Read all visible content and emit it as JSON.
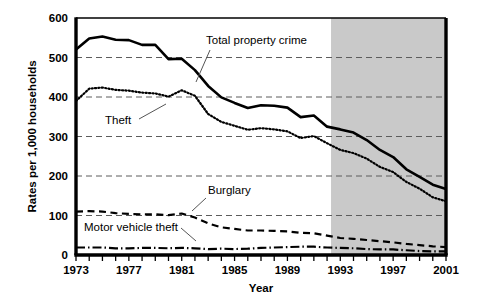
{
  "chart_data": {
    "type": "line",
    "title": "",
    "xlabel": "Year",
    "ylabel": "Rates per 1,000 households",
    "xlim": [
      1973,
      2001
    ],
    "ylim": [
      0,
      600
    ],
    "ytick_labels": [
      "0",
      "100",
      "200",
      "300",
      "400",
      "500",
      "600"
    ],
    "ytick_values": [
      0,
      100,
      200,
      300,
      400,
      500,
      600
    ],
    "xtick_labels": [
      "1973",
      "1977",
      "1981",
      "1985",
      "1989",
      "1993",
      "1997",
      "2001"
    ],
    "xtick_values": [
      1973,
      1977,
      1981,
      1985,
      1989,
      1993,
      1997,
      2001
    ],
    "grid": "horizontal-dashed",
    "legend_position": "inline-annotations",
    "shaded_region": {
      "label": "",
      "x_start": 1992.3,
      "x_end": 2001,
      "color": "#c9c9c9"
    },
    "x": [
      1973,
      1974,
      1975,
      1976,
      1977,
      1978,
      1979,
      1980,
      1981,
      1982,
      1983,
      1984,
      1985,
      1986,
      1987,
      1988,
      1989,
      1990,
      1991,
      1992,
      1993,
      1994,
      1995,
      1996,
      1997,
      1998,
      1999,
      2000,
      2001
    ],
    "series": [
      {
        "name": "Total property crime",
        "style": "solid",
        "values": [
          520,
          548,
          553,
          545,
          544,
          532,
          532,
          496,
          497,
          468,
          428,
          399,
          385,
          372,
          379,
          378,
          373,
          349,
          353,
          325,
          318,
          310,
          291,
          266,
          248,
          217,
          198,
          178,
          167
        ]
      },
      {
        "name": "Theft",
        "style": "dotted",
        "values": [
          390,
          421,
          424,
          418,
          416,
          411,
          409,
          401,
          417,
          403,
          357,
          337,
          327,
          317,
          321,
          318,
          313,
          296,
          301,
          283,
          266,
          258,
          244,
          223,
          210,
          185,
          168,
          146,
          136
        ]
      },
      {
        "name": "Burglary",
        "style": "dashed",
        "values": [
          110,
          111,
          110,
          106,
          104,
          103,
          103,
          101,
          105,
          95,
          80,
          70,
          66,
          62,
          62,
          61,
          60,
          56,
          55,
          49,
          43,
          41,
          38,
          35,
          32,
          28,
          25,
          22,
          20
        ]
      },
      {
        "name": "Motor vehicle theft",
        "style": "dash-dot",
        "values": [
          19,
          19,
          19,
          17,
          17,
          18,
          18,
          17,
          18,
          17,
          15,
          16,
          15,
          16,
          18,
          19,
          20,
          21,
          21,
          19,
          18,
          17,
          15,
          14,
          14,
          12,
          10,
          9,
          9
        ]
      }
    ],
    "annotations": [
      {
        "name": "total-property-crime-label",
        "text": "Total property crime",
        "text_x": 206,
        "text_y": 44,
        "leader": [
          210,
          50,
          196,
          82
        ]
      },
      {
        "name": "theft-label",
        "text": "Theft",
        "text_x": 105,
        "text_y": 124,
        "leader": [
          139,
          119,
          166,
          104
        ]
      },
      {
        "name": "burglary-label",
        "text": "Burglary",
        "text_x": 208,
        "text_y": 194,
        "leader": [
          206,
          198,
          192,
          211
        ]
      },
      {
        "name": "motor-vehicle-theft-label",
        "text": "Motor vehicle theft",
        "text_x": 84,
        "text_y": 231,
        "leader": [
          181,
          228,
          196,
          241
        ]
      }
    ]
  }
}
